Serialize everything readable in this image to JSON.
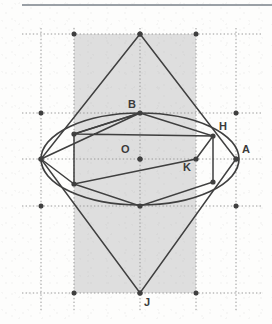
{
  "figure": {
    "width": 272,
    "height": 324,
    "background_color": "#fdfdfc",
    "shaded_fill": "#dedede",
    "stroke_color": "#3f3f3f",
    "grid_color": "#9a9a9a",
    "label_color": "#3a3a3a",
    "top_rule_color": "#9aa0a6"
  },
  "grid": {
    "vertical_lines_x": [
      41,
      74,
      140,
      196,
      236
    ],
    "horizontal_lines_y": [
      34,
      113,
      159,
      206,
      293
    ],
    "style": "dotted",
    "nodes": [
      {
        "x": 74,
        "y": 34
      },
      {
        "x": 140,
        "y": 34
      },
      {
        "x": 196,
        "y": 34
      },
      {
        "x": 41,
        "y": 113
      },
      {
        "x": 236,
        "y": 113
      },
      {
        "x": 41,
        "y": 159
      },
      {
        "x": 140,
        "y": 159
      },
      {
        "x": 236,
        "y": 159
      },
      {
        "x": 41,
        "y": 206
      },
      {
        "x": 236,
        "y": 206
      },
      {
        "x": 74,
        "y": 293
      },
      {
        "x": 140,
        "y": 293
      },
      {
        "x": 196,
        "y": 293
      }
    ]
  },
  "shaded_rect": {
    "x": 74,
    "y": 34,
    "width": 122,
    "height": 259
  },
  "ellipse": {
    "cx": 140,
    "cy": 159,
    "rx": 99,
    "ry": 46
  },
  "points": [
    {
      "name": "B",
      "x": 140,
      "y": 113,
      "label_dx": -12,
      "label_dy": -14,
      "marked": true
    },
    {
      "name": "O",
      "x": 140,
      "y": 159,
      "label_dx": -19,
      "label_dy": -15,
      "marked": true
    },
    {
      "name": "A",
      "x": 236,
      "y": 159,
      "label_dx": 6,
      "label_dy": -15,
      "marked": true
    },
    {
      "name": "H",
      "x": 213,
      "y": 136,
      "label_dx": 6,
      "label_dy": -15,
      "marked": true
    },
    {
      "name": "K",
      "x": 196,
      "y": 159,
      "label_dx": -13,
      "label_dy": 3,
      "marked": true
    },
    {
      "name": "J",
      "x": 140,
      "y": 293,
      "label_dx": 4,
      "label_dy": 4,
      "marked": true
    }
  ],
  "unlabeled_vertices": [
    {
      "x": 140,
      "y": 34
    },
    {
      "x": 41,
      "y": 159
    },
    {
      "x": 74,
      "y": 134
    },
    {
      "x": 74,
      "y": 184
    },
    {
      "x": 140,
      "y": 206
    },
    {
      "x": 213,
      "y": 182
    }
  ],
  "polygons": [
    {
      "name": "hexagon-1",
      "vertices": [
        [
          140,
          113
        ],
        [
          213,
          136
        ],
        [
          213,
          182
        ],
        [
          140,
          206
        ],
        [
          74,
          184
        ],
        [
          74,
          134
        ]
      ]
    },
    {
      "name": "hexagon-2",
      "vertices": [
        [
          140,
          113
        ],
        [
          41,
          159
        ],
        [
          74,
          184
        ],
        [
          196,
          159
        ],
        [
          213,
          136
        ],
        [
          74,
          134
        ]
      ]
    }
  ],
  "kite": {
    "name": "kite-apex-J",
    "vertices": [
      [
        140,
        34
      ],
      [
        236,
        159
      ],
      [
        140,
        293
      ],
      [
        41,
        159
      ]
    ]
  },
  "axes": {
    "horizontal_y": 159,
    "vertical_x": 140
  }
}
